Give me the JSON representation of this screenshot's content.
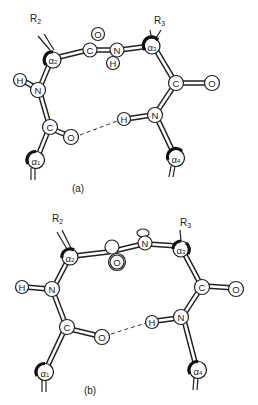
{
  "figure": {
    "panels": [
      {
        "id": "a",
        "caption": "(a)",
        "substituents": {
          "r2": "R",
          "r2_sub": "2",
          "r3": "R",
          "r3_sub": "3"
        },
        "atoms": {
          "alpha1": {
            "label": "α",
            "sub": "1"
          },
          "alpha2": {
            "label": "α",
            "sub": "2"
          },
          "alpha3": {
            "label": "α",
            "sub": "3"
          },
          "alpha4": {
            "label": "α",
            "sub": "4"
          },
          "n1": "N",
          "h1": "H",
          "c1": "C",
          "o1": "O",
          "c2": "C",
          "o2": "O",
          "n2": "N",
          "h2": "H",
          "c3": "C",
          "o3": "O",
          "n3": "N",
          "h3": "H"
        },
        "hydrogen_bond": "O1···H3 (dashed)"
      },
      {
        "id": "b",
        "caption": "(b)",
        "substituents": {
          "r2": "R",
          "r2_sub": "2",
          "r3": "R",
          "r3_sub": "3"
        },
        "atoms": {
          "alpha1": {
            "label": "α",
            "sub": "1"
          },
          "alpha2": {
            "label": "α",
            "sub": "2"
          },
          "alpha3": {
            "label": "α",
            "sub": "3"
          },
          "alpha4": {
            "label": "α",
            "sub": "4"
          },
          "n1": "N",
          "h1": "H",
          "c1": "C",
          "o1": "O",
          "o2": "O",
          "n2": "N",
          "c3": "C",
          "o3": "O",
          "n3": "N",
          "h3": "H"
        },
        "hydrogen_bond": "O1···H3 (dashed)"
      }
    ]
  }
}
